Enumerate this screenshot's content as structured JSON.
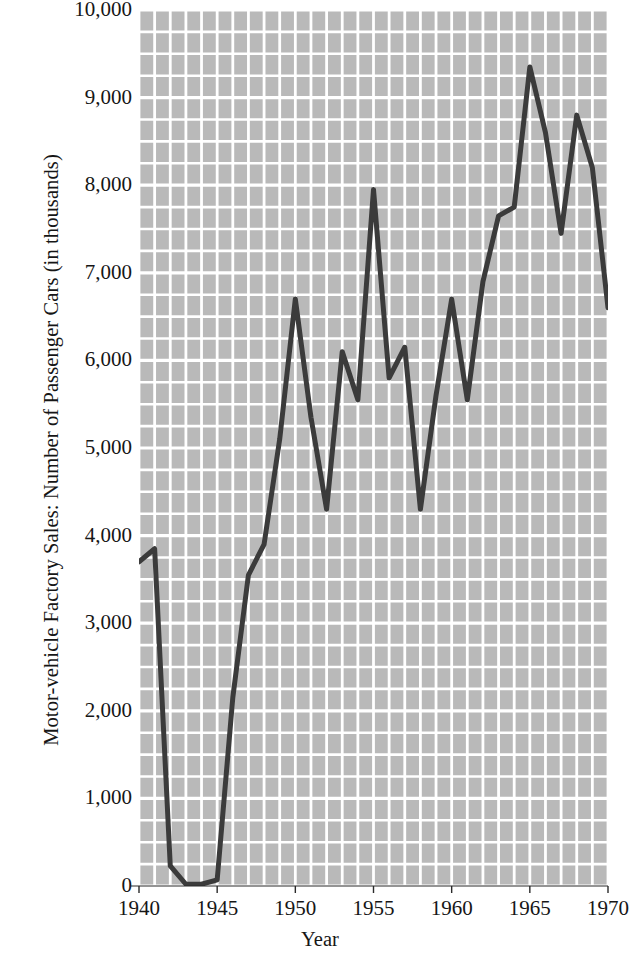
{
  "chart_data": {
    "type": "line",
    "title": "",
    "xlabel": "Year",
    "ylabel": "Motor-vehicle Factory Sales: Number of Passenger Cars (in thousands)",
    "xlim": [
      1940,
      1970
    ],
    "ylim": [
      0,
      10000
    ],
    "x_ticks": [
      1940,
      1945,
      1950,
      1955,
      1960,
      1965,
      1970
    ],
    "x_tick_labels": [
      "1940",
      "1945",
      "1950",
      "1955",
      "1960",
      "1965",
      "1970"
    ],
    "y_ticks": [
      0,
      1000,
      2000,
      3000,
      4000,
      5000,
      6000,
      7000,
      8000,
      9000,
      10000
    ],
    "y_tick_labels": [
      "0",
      "1,000",
      "2,000",
      "3,000",
      "4,000",
      "5,000",
      "6,000",
      "7,000",
      "8,000",
      "9,000",
      "10,000"
    ],
    "grid": true,
    "grid_color": "#ffffff",
    "grid_minor_x_step": 1,
    "grid_minor_y_step": 250,
    "plot_background": "#b9b9b9",
    "line_color": "#3b3b3b",
    "line_width": 5,
    "legend": null,
    "x": [
      1940,
      1941,
      1942,
      1943,
      1944,
      1945,
      1946,
      1947,
      1948,
      1949,
      1950,
      1951,
      1952,
      1953,
      1954,
      1955,
      1956,
      1957,
      1958,
      1959,
      1960,
      1961,
      1962,
      1963,
      1964,
      1965,
      1966,
      1967,
      1968,
      1969,
      1970
    ],
    "values": [
      3700,
      3850,
      230,
      20,
      20,
      70,
      2150,
      3550,
      3900,
      5100,
      6700,
      5350,
      4300,
      6100,
      5550,
      7950,
      5800,
      6150,
      4300,
      5600,
      6700,
      5550,
      6900,
      7650,
      7750,
      9350,
      8600,
      7450,
      8800,
      8200,
      6600
    ],
    "series": [
      {
        "name": "Motor-vehicle Factory Sales",
        "values": [
          3700,
          3850,
          230,
          20,
          20,
          70,
          2150,
          3550,
          3900,
          5100,
          6700,
          5350,
          4300,
          6100,
          5550,
          7950,
          5800,
          6150,
          4300,
          5600,
          6700,
          5550,
          6900,
          7650,
          7750,
          9350,
          8600,
          7450,
          8800,
          8200,
          6600
        ]
      }
    ]
  }
}
